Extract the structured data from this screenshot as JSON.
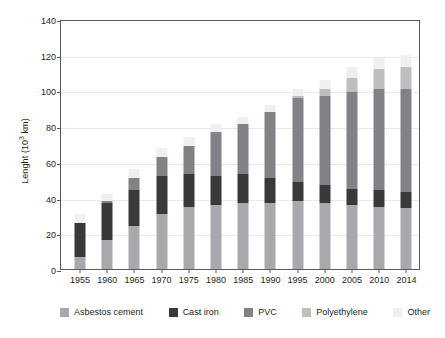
{
  "chart_data": {
    "type": "bar",
    "subtype": "stacked-bar",
    "title": "",
    "xlabel": "",
    "ylabel": "Lenght (10³ km)",
    "ylabel_prefix": "Lenght (10",
    "ylabel_sup": "3",
    "ylabel_suffix": " km)",
    "ylim": [
      0,
      140
    ],
    "yticks": [
      0,
      20,
      40,
      60,
      80,
      100,
      120,
      140
    ],
    "grid": true,
    "grid_axis": "y",
    "legend_position": "bottom",
    "categories": [
      "1955",
      "1960",
      "1965",
      "1970",
      "1975",
      "1980",
      "1985",
      "1990",
      "1995",
      "2000",
      "2005",
      "2010",
      "2014"
    ],
    "series": [
      {
        "name": "Asbestos cement",
        "color": "#a7a9ac",
        "values": [
          7,
          16,
          24,
          31,
          35,
          36,
          37,
          37,
          38,
          37,
          36,
          35,
          34
        ]
      },
      {
        "name": "Cast iron",
        "color": "#39393b",
        "values": [
          19,
          21,
          20,
          21,
          18,
          16,
          16,
          14,
          11,
          10,
          9,
          9,
          9
        ]
      },
      {
        "name": "PVC",
        "color": "#808285",
        "values": [
          0,
          1,
          7,
          11,
          16,
          25,
          28,
          37,
          47,
          50,
          54,
          57,
          58
        ]
      },
      {
        "name": "Polyethylene",
        "color": "#bcbec0",
        "values": [
          0,
          0,
          0,
          0,
          0,
          0,
          0,
          0,
          1,
          4,
          8,
          11,
          12
        ]
      },
      {
        "name": "Other",
        "color": "#eeeff0",
        "values": [
          5,
          4,
          5,
          5,
          5,
          4,
          4,
          4,
          4,
          5,
          6,
          6,
          7
        ]
      }
    ],
    "totals": [
      31,
      42,
      56,
      68,
      74,
      81,
      85,
      92,
      101,
      106,
      113,
      118,
      120
    ]
  }
}
